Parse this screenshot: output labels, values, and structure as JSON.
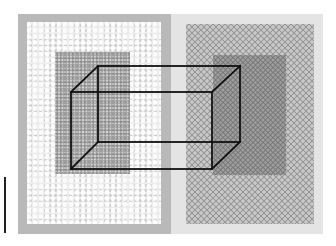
{
  "figure": {
    "left_panel": {
      "style": "light lace texture with darker speckled inner rectangle",
      "colors": {
        "outer": "#b9b9b9",
        "lace": "#ececec",
        "inner": "#a9a9a9"
      }
    },
    "right_panel": {
      "style": "grey lace texture with darker inner rectangle",
      "colors": {
        "outer": "#e4e4e4",
        "lace": "#c8c8c8",
        "inner": "#9e9e9e"
      }
    },
    "cube": {
      "stroke_color": "#111111",
      "front_face": {
        "x1": 71,
        "y1": 92,
        "x2": 212,
        "y2": 169
      },
      "back_face": {
        "x1": 98,
        "y1": 66,
        "x2": 240,
        "y2": 142
      }
    },
    "scale_bar": {
      "color": "#222222"
    }
  }
}
